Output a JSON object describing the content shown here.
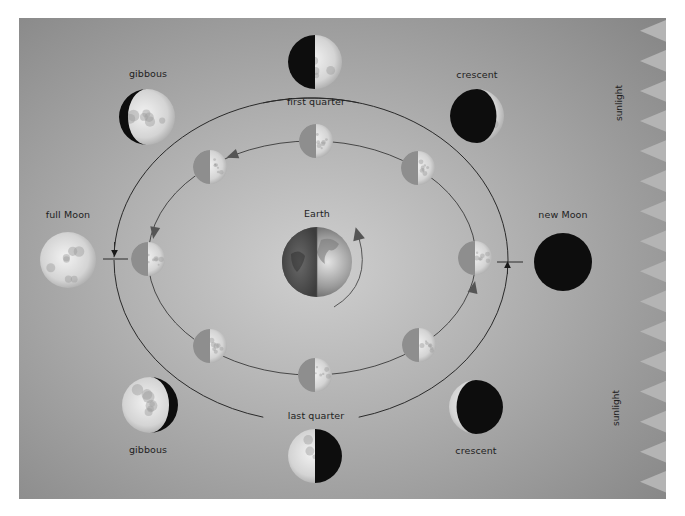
{
  "diagram": {
    "colors": {
      "panel_center": "#cfcfcf",
      "panel_edge": "#858585",
      "sunlight_tooth": "#b4b4b4",
      "orbit_line": "#2a2a2a",
      "arrow_inner": "#555555",
      "moon_dark": "#0d0d0d",
      "moon_lit": "#e6e6e6",
      "inner_moon_shadow": "#8e8e8e",
      "label": "#1e1e1e"
    },
    "panel": {
      "x": 19,
      "y": 18,
      "width": 647,
      "height": 481
    },
    "sunlight": {
      "label_top": "sunlight",
      "label_bottom": "sunlight",
      "tooth_count": 16,
      "tooth_depth": 26
    },
    "earth": {
      "label": "Earth",
      "cx": 317,
      "cy": 262,
      "r": 35
    },
    "outer_phases": [
      {
        "id": "first-quarter",
        "label": "first quarter",
        "cx": 315,
        "cy": 62,
        "r": 27,
        "label_x": 316,
        "label_y": 101,
        "lit": "right-half"
      },
      {
        "id": "waxing-crescent",
        "label": "crescent",
        "cx": 477,
        "cy": 116,
        "r": 27,
        "label_x": 477,
        "label_y": 74,
        "lit": "right-sliver"
      },
      {
        "id": "waxing-gibbous",
        "label": "gibbous",
        "cx": 147,
        "cy": 117,
        "r": 28,
        "label_x": 148,
        "label_y": 73,
        "lit": "left-gibbous"
      },
      {
        "id": "full-moon",
        "label": "full Moon",
        "cx": 68,
        "cy": 260,
        "r": 28,
        "label_x": 68,
        "label_y": 214,
        "lit": "full"
      },
      {
        "id": "new-moon",
        "label": "new Moon",
        "cx": 563,
        "cy": 262,
        "r": 29,
        "label_x": 563,
        "label_y": 214,
        "lit": "none"
      },
      {
        "id": "waning-gibbous",
        "label": "gibbous",
        "cx": 150,
        "cy": 405,
        "r": 28,
        "label_x": 148,
        "label_y": 449,
        "lit": "right-gibbous-dark"
      },
      {
        "id": "last-quarter",
        "label": "last quarter",
        "cx": 315,
        "cy": 456,
        "r": 27,
        "label_x": 316,
        "label_y": 415,
        "lit": "left-half"
      },
      {
        "id": "waning-crescent",
        "label": "crescent",
        "cx": 476,
        "cy": 407,
        "r": 27,
        "label_x": 476,
        "label_y": 450,
        "lit": "left-sliver"
      }
    ],
    "inner_moons": [
      {
        "cx": 316,
        "cy": 141
      },
      {
        "cx": 210,
        "cy": 167
      },
      {
        "cx": 148,
        "cy": 259
      },
      {
        "cx": 210,
        "cy": 346
      },
      {
        "cx": 315,
        "cy": 375
      },
      {
        "cx": 419,
        "cy": 345
      },
      {
        "cx": 475,
        "cy": 258
      },
      {
        "cx": 418,
        "cy": 168
      }
    ],
    "inner_moon_r": 17,
    "outer_orbit": {
      "cx": 311,
      "cy": 260,
      "rx": 197,
      "ry": 162
    },
    "inner_orbit": {
      "cx": 312,
      "cy": 258,
      "rx": 164,
      "ry": 117
    }
  }
}
